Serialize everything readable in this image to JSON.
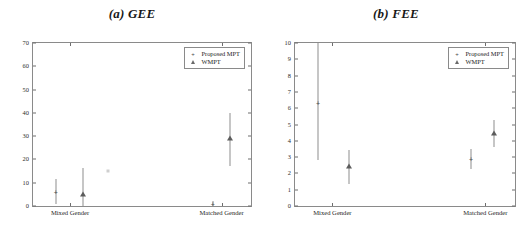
{
  "figure": {
    "background": "#ffffff",
    "axis_color": "#8a8a8a",
    "marker_color": "#4a4a4a",
    "errorbar_color": "#8d8d8d"
  },
  "legend": {
    "entries": [
      {
        "label": "Proposed MPT",
        "symbol": "cross-marker"
      },
      {
        "label": "WMPT",
        "symbol": "triangle-marker"
      }
    ]
  },
  "chart_data": [
    {
      "type": "scatter",
      "title": "(a) GEE",
      "xlabel": "",
      "ylabel": "Gross Error (%)",
      "ylim": [
        0,
        70
      ],
      "yticks": [
        0,
        10,
        20,
        30,
        40,
        50,
        60,
        70
      ],
      "ytick_labels": [
        "0",
        "10",
        "20",
        "30",
        "40",
        "50",
        "60",
        "70"
      ],
      "categories": [
        "Mixed Gender",
        "Matched Gender"
      ],
      "grid": false,
      "legend_position": "top-right",
      "series": [
        {
          "name": "Proposed MPT",
          "marker": "cross-marker",
          "points": [
            {
              "category": "Mixed Gender",
              "x_frac": 0.105,
              "value": 6.0,
              "low": 1.0,
              "high": 11.5
            },
            {
              "category": "Matched Gender",
              "x_frac": 0.825,
              "value": 1.0,
              "low": 0.2,
              "high": 2.0
            }
          ]
        },
        {
          "name": "WMPT",
          "marker": "triangle-marker",
          "points": [
            {
              "category": "Mixed Gender",
              "x_frac": 0.23,
              "value": 5.0,
              "low": 0.0,
              "high": 16.5
            },
            {
              "category": "Matched Gender",
              "x_frac": 0.905,
              "value": 29.0,
              "low": 17.0,
              "high": 40.0
            }
          ]
        }
      ],
      "stray_markers": [
        {
          "x_frac": 0.345,
          "value": 15.0
        }
      ]
    },
    {
      "type": "scatter",
      "title": "(b) FEE",
      "xlabel": "",
      "ylabel": "Fine Error (%)",
      "ylim": [
        0,
        10
      ],
      "yticks": [
        0,
        1,
        2,
        3,
        4,
        5,
        6,
        7,
        8,
        9,
        10
      ],
      "ytick_labels": [
        "0",
        "1",
        "2",
        "3",
        "4",
        "5",
        "6",
        "7",
        "8",
        "9",
        "10"
      ],
      "categories": [
        "Mixed Gender",
        "Matched Gender"
      ],
      "grid": false,
      "legend_position": "top-right",
      "series": [
        {
          "name": "Proposed MPT",
          "marker": "cross-marker",
          "points": [
            {
              "category": "Mixed Gender",
              "x_frac": 0.105,
              "value": 6.3,
              "low": 2.8,
              "high": 10.0
            },
            {
              "category": "Matched Gender",
              "x_frac": 0.8,
              "value": 2.9,
              "low": 2.25,
              "high": 3.5
            }
          ]
        },
        {
          "name": "WMPT",
          "marker": "triangle-marker",
          "points": [
            {
              "category": "Mixed Gender",
              "x_frac": 0.245,
              "value": 2.45,
              "low": 1.35,
              "high": 3.45
            },
            {
              "category": "Matched Gender",
              "x_frac": 0.905,
              "value": 4.5,
              "low": 3.6,
              "high": 5.3
            }
          ]
        }
      ],
      "stray_markers": []
    }
  ],
  "xtick_positions": {
    "mixed_frac": 0.17,
    "matched_frac": 0.865
  }
}
